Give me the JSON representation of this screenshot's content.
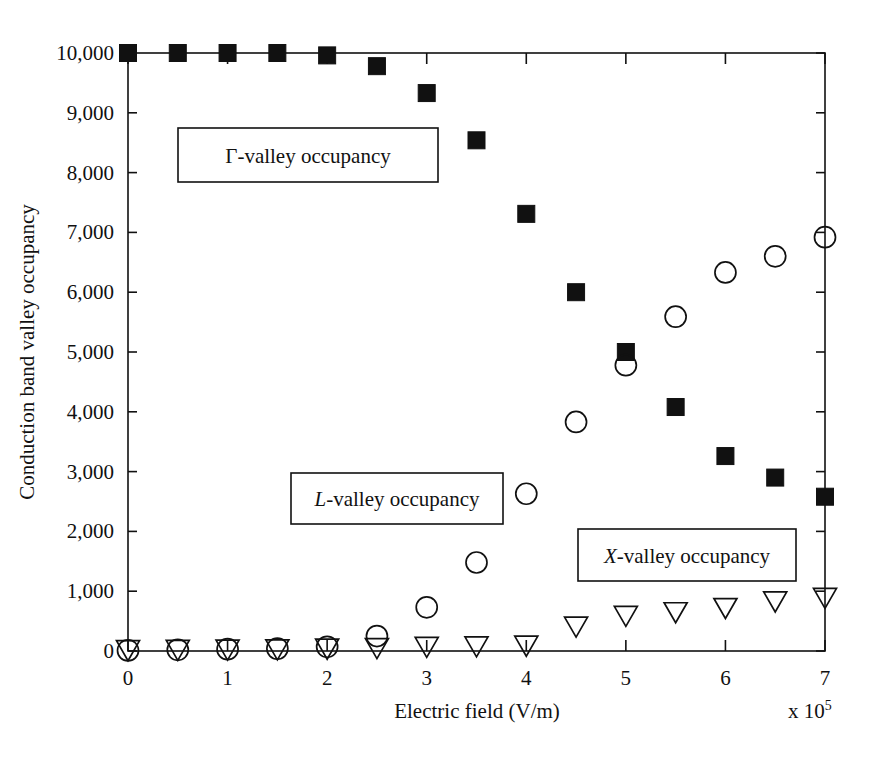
{
  "chart_data": {
    "type": "scatter",
    "title": "",
    "xlabel": "Electric field (V/m)",
    "ylabel": "Conduction band valley occupancy",
    "x_multiplier_label": "x 10",
    "x_multiplier_exponent": "5",
    "xlim": [
      0,
      7
    ],
    "ylim": [
      0,
      10000
    ],
    "xticks": [
      "0",
      "1",
      "2",
      "3",
      "4",
      "5",
      "6",
      "7"
    ],
    "xtick_values": [
      0,
      1,
      2,
      3,
      4,
      5,
      6,
      7
    ],
    "yticks": [
      "0",
      "1,000",
      "2,000",
      "3,000",
      "4,000",
      "5,000",
      "6,000",
      "7,000",
      "8,000",
      "9,000",
      "10,000"
    ],
    "ytick_values": [
      0,
      1000,
      2000,
      3000,
      4000,
      5000,
      6000,
      7000,
      8000,
      9000,
      10000
    ],
    "grid": false,
    "legend_position": "inside-annotations",
    "x": [
      0,
      0.5,
      1.0,
      1.5,
      2.0,
      2.5,
      3.0,
      3.5,
      4.0,
      4.5,
      5.0,
      5.5,
      6.0,
      6.5,
      7.0
    ],
    "series": [
      {
        "name": "Γ-valley occupancy",
        "marker": "filled-square",
        "color": "#111111",
        "values": [
          10000,
          10000,
          10000,
          10000,
          9960,
          9780,
          9330,
          8540,
          7310,
          6000,
          5000,
          4080,
          3260,
          2900,
          2580
        ]
      },
      {
        "name": "L-valley occupancy",
        "marker": "open-circle",
        "color": "#111111",
        "values": [
          10,
          20,
          30,
          40,
          70,
          250,
          730,
          1480,
          2630,
          3830,
          4780,
          5590,
          6330,
          6600,
          6920
        ]
      },
      {
        "name": "X-valley occupancy",
        "marker": "open-triangle-down",
        "color": "#111111",
        "values": [
          5,
          10,
          15,
          20,
          30,
          40,
          60,
          70,
          80,
          400,
          580,
          640,
          710,
          820,
          880
        ]
      }
    ],
    "annotations": [
      {
        "text": "Γ-valley occupancy",
        "italic_prefix": "",
        "plain": "Γ-valley occupancy",
        "box": true
      },
      {
        "text": "L-valley occupancy",
        "italic_prefix": "L",
        "plain": "-valley occupancy",
        "box": true
      },
      {
        "text": "X-valley occupancy",
        "italic_prefix": "X",
        "plain": "-valley occupancy",
        "box": true
      }
    ]
  },
  "axis": {
    "y_title": "Conduction band valley occupancy",
    "x_title": "Electric field (V/m)",
    "x_multiplier": "x 10",
    "x_multiplier_exp": "5",
    "ytick_0": "0",
    "ytick_1": "1,000",
    "ytick_2": "2,000",
    "ytick_3": "3,000",
    "ytick_4": "4,000",
    "ytick_5": "5,000",
    "ytick_6": "6,000",
    "ytick_7": "7,000",
    "ytick_8": "8,000",
    "ytick_9": "9,000",
    "ytick_10": "10,000",
    "xtick_0": "0",
    "xtick_1": "1",
    "xtick_2": "2",
    "xtick_3": "3",
    "xtick_4": "4",
    "xtick_5": "5",
    "xtick_6": "6",
    "xtick_7": "7"
  },
  "legend": {
    "gamma_label": "Γ-valley occupancy",
    "l_italic": "L",
    "l_rest": "-valley occupancy",
    "x_italic": "X",
    "x_rest": "-valley occupancy"
  },
  "colors": {
    "ink": "#111111",
    "background": "#ffffff",
    "marker_fill": "#111111",
    "marker_open": "none"
  }
}
